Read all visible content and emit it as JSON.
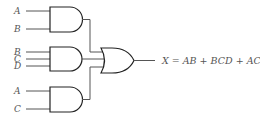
{
  "diagram": {
    "type": "logic-circuit",
    "gates": [
      {
        "id": "and1",
        "kind": "AND",
        "inputs": [
          "A",
          "B"
        ]
      },
      {
        "id": "and2",
        "kind": "AND",
        "inputs": [
          "B",
          "C",
          "D"
        ]
      },
      {
        "id": "and3",
        "kind": "AND",
        "inputs": [
          "A",
          "C"
        ]
      },
      {
        "id": "or1",
        "kind": "OR",
        "inputs": [
          "and1",
          "and2",
          "and3"
        ]
      }
    ],
    "labels": {
      "and1_in1": "A",
      "and1_in2": "B",
      "and2_in1": "B",
      "and2_in2": "C",
      "and2_in3": "D",
      "and3_in1": "A",
      "and3_in2": "C"
    },
    "output_expression": "X = AB + BCD + AC"
  }
}
